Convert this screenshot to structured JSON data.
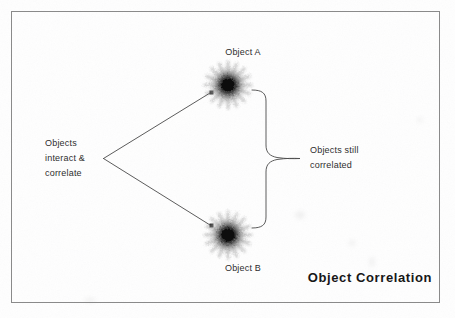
{
  "diagram": {
    "title": "Object Correlation",
    "background_color": "#fefefe",
    "frame_color": "#8a8a8a",
    "ink_color": "#2e2e2e",
    "title_color": "#171717",
    "nodes": [
      {
        "id": "object-a",
        "label": "Object A",
        "label_position": "above",
        "glyph": "starburst-blob"
      },
      {
        "id": "object-b",
        "label": "Object B",
        "label_position": "below",
        "glyph": "starburst-blob"
      }
    ],
    "annotations": [
      {
        "id": "interact",
        "text": "Objects\ninteract &\ncorrelate",
        "lines": [
          "Objects",
          "interact &",
          "correlate"
        ],
        "connector": "two-diverging-arrows"
      },
      {
        "id": "correlated",
        "text": "Objects still\ncorrelated",
        "lines": [
          "Objects still",
          "correlated"
        ],
        "connector": "curly-brace"
      }
    ],
    "connectors": [
      {
        "id": "arrow-to-object-a",
        "kind": "arrow",
        "from": "interact-vertex",
        "to": "object-a"
      },
      {
        "id": "arrow-to-object-b",
        "kind": "arrow",
        "from": "interact-vertex",
        "to": "object-b"
      },
      {
        "id": "brace-object-a-object-b",
        "kind": "curly-brace",
        "spans": [
          "object-a",
          "object-b"
        ],
        "points_to": "correlated"
      }
    ]
  }
}
